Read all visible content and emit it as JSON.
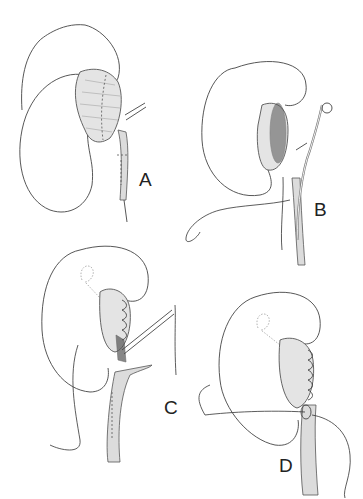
{
  "figure": {
    "panels": [
      {
        "id": "A",
        "label": "A",
        "caption": "Dilated renal pelvis with planned incision lines (dashed) at pelvis and ureter"
      },
      {
        "id": "B",
        "label": "B",
        "caption": "Pelvis opened; ureter spatulated; double-J stent and stay suture placed"
      },
      {
        "id": "C",
        "label": "C",
        "caption": "Pelvis closure with running suture; ureteropelvic anastomosis begun with stent in place"
      },
      {
        "id": "D",
        "label": "D",
        "caption": "Completed anastomosis with running suture; stent coil shown in kidney"
      }
    ],
    "colors": {
      "line": "#444444",
      "background": "#ffffff",
      "shade": "#e4e4e4"
    }
  }
}
